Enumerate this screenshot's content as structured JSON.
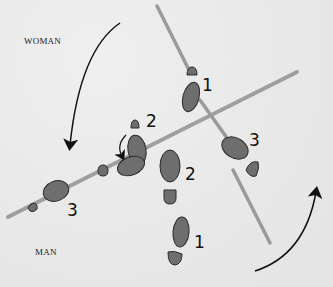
{
  "diagram": {
    "type": "dance-step footprint diagram",
    "labels": {
      "woman": "WOMAN",
      "man": "MAN"
    },
    "step_numbers": {
      "woman_1": "1",
      "woman_2": "2",
      "woman_3": "3",
      "man_1": "1",
      "man_2": "2",
      "man_3": "3"
    },
    "colors": {
      "background": "#e9e9e9",
      "footprint_fill": "#6e6e6e",
      "footprint_stroke": "#2a2a2a",
      "line_color": "#9a9a9a",
      "arrow_color": "#111111"
    },
    "arrows": [
      {
        "name": "woman-rotation-arrow",
        "direction": "counter-clockwise-down"
      },
      {
        "name": "man-rotation-arrow",
        "direction": "clockwise-up"
      },
      {
        "name": "pivot-arrow",
        "direction": "curved-down"
      }
    ]
  }
}
